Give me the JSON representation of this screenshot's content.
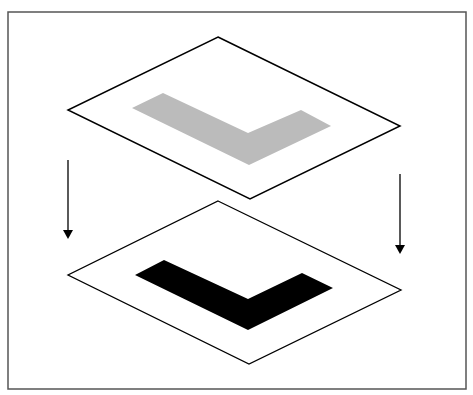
{
  "diagram": {
    "colors": {
      "frame": "#555555",
      "plane_stroke": "#000000",
      "top_shape": "#bbbbbb",
      "bottom_shape": "#000000",
      "arrow": "#000000"
    },
    "top_plane": {
      "points": "218,37 400,126 250,199 68,110"
    },
    "top_shape": {
      "points": "163,93 248,133 301,110 331,126 249,165 132,108"
    },
    "bottom_plane": {
      "points": "218,201 401,290 249,364 68,275"
    },
    "bottom_shape": {
      "points": "164,260 248,299 302,273 333,288 248,330 135,275"
    }
  }
}
